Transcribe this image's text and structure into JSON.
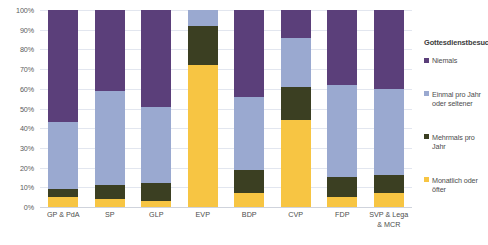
{
  "chart_data": {
    "type": "bar",
    "subtype": "stacked-100-percent",
    "title": "",
    "xlabel": "",
    "ylabel": "",
    "ylim": [
      0,
      100
    ],
    "ytick_labels": [
      "100%",
      "90%",
      "80%",
      "70%",
      "60%",
      "50%",
      "40%",
      "30%",
      "20%",
      "10%",
      "0%"
    ],
    "ytick_values": [
      100,
      90,
      80,
      70,
      60,
      50,
      40,
      30,
      20,
      10,
      0
    ],
    "grid": true,
    "legend_position": "right",
    "legend_title": "Gottesdienstbesuch",
    "categories": [
      "GP & PdA",
      "SP",
      "GLP",
      "EVP",
      "BDP",
      "CVP",
      "FDP",
      "SVP & Lega & MCR"
    ],
    "series": [
      {
        "name": "Monatlich oder öfter",
        "color": "#f7c543",
        "values": [
          5,
          4,
          3,
          72,
          7,
          44,
          5,
          7
        ]
      },
      {
        "name": "Mehrmals pro Jahr",
        "color": "#3b3f22",
        "values": [
          4,
          7,
          9,
          20,
          12,
          17,
          10,
          9
        ]
      },
      {
        "name": "Einmal pro Jahr oder seltener",
        "color": "#9aa9d0",
        "values": [
          34,
          48,
          39,
          8,
          37,
          25,
          47,
          44
        ]
      },
      {
        "name": "Niemals",
        "color": "#5b3f7a",
        "values": [
          57,
          41,
          49,
          0,
          44,
          14,
          38,
          40
        ]
      }
    ],
    "stack_order_bottom_to_top": [
      "Monatlich oder öfter",
      "Mehrmals pro Jahr",
      "Einmal pro Jahr oder seltener",
      "Niemals"
    ],
    "legend_entries": [
      {
        "label": "Niemals",
        "color": "#5b3f7a"
      },
      {
        "label": "Einmal pro Jahr oder seltener",
        "color": "#9aa9d0"
      },
      {
        "label": "Mehrmals pro Jahr",
        "color": "#3b3f22"
      },
      {
        "label": "Monatlich oder öfter",
        "color": "#f7c543"
      }
    ],
    "colors": {
      "niemals": "#5b3f7a",
      "einmal_pro_jahr_oder_seltener": "#9aa9d0",
      "mehrmals_pro_jahr": "#3b3f22",
      "monatlich_oder_oefter": "#f7c543",
      "gridline": "#e2e6ef",
      "axis_text": "#4d4d4d"
    }
  }
}
